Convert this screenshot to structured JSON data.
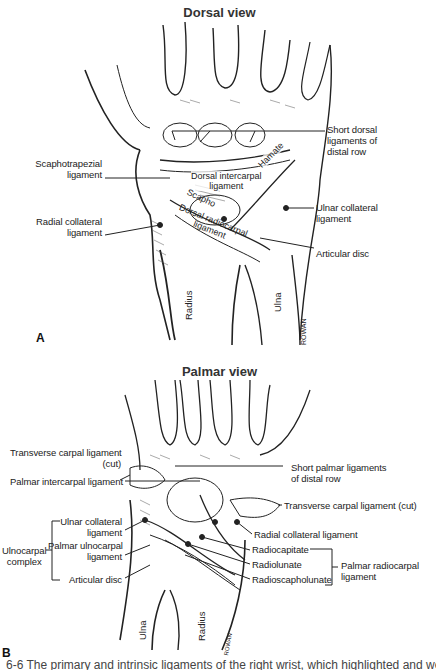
{
  "panels": {
    "a": {
      "title": "Dorsal view",
      "letter": "A",
      "labels": {
        "short_dorsal": [
          "Short dorsal",
          "ligaments of",
          "distal row"
        ],
        "scaphotrapezial": [
          "Scaphotrapezial",
          "ligament"
        ],
        "radial_collateral": [
          "Radial collateral",
          "ligament"
        ],
        "ulnar_collateral": [
          "Ulnar collateral",
          "ligament"
        ],
        "articular_disc": "Articular disc",
        "hamate": "Hamate",
        "dorsal_intercarpal": [
          "Dorsal intercarpal",
          "ligament"
        ],
        "scapho": "Scapho",
        "dorsal_radiocarpal": [
          "Dorsal radiocarpal",
          "ligament"
        ],
        "radius": "Radius",
        "ulna": "Ulna",
        "signature": "ROWAN"
      }
    },
    "b": {
      "title": "Palmar view",
      "letter": "B",
      "labels": {
        "transverse_cut_left": [
          "Transverse carpal ligament",
          "(cut)"
        ],
        "short_palmar": [
          "Short palmar ligaments",
          "of distal row"
        ],
        "palmar_intercarpal": "Palmar intercarpal ligament",
        "transverse_cut_right": "Transverse carpal ligament (cut)",
        "ulnar_collateral": [
          "Ulnar collateral",
          "ligament"
        ],
        "radial_collateral": "Radial collateral ligament",
        "palmar_ulnocarpal": [
          "Palmar ulnocarpal",
          "ligament"
        ],
        "ulnocarpal_complex": [
          "Ulnocarpal",
          "complex"
        ],
        "articular_disc": "Articular disc",
        "radiocapitate": "Radiocapitate",
        "radiolunate": "Radiolunate",
        "radioscapholunate": "Radioscapholunate",
        "palmar_radiocarpal": [
          "Palmar radiocarpal",
          "ligament"
        ],
        "ulna": "Ulna",
        "radius": "Radius",
        "signature": "ROWAN"
      }
    }
  },
  "caption": "6-6 The primary and intrinsic ligaments of the right wrist, which highlighted and weighted. A. Wrist"
}
